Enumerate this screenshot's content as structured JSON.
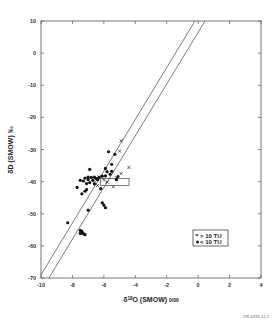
{
  "chart_data": {
    "type": "scatter",
    "title": "",
    "xlabel": "δ18O (SMOW) ‰",
    "ylabel": "δD (SMOW) ‰",
    "xlim": [
      -10,
      4
    ],
    "ylim": [
      -70,
      10
    ],
    "x_ticks": [
      -10,
      -8,
      -6,
      -4,
      -2,
      0,
      2,
      4
    ],
    "y_ticks": [
      10,
      0,
      -10,
      -20,
      -30,
      -40,
      -50,
      -60,
      -70
    ],
    "grid": false,
    "legend_position": "lower right inside",
    "series": [
      {
        "name": "> 10 TU",
        "marker": "x",
        "points": [
          [
            -4.9,
            -27.3
          ],
          [
            -5.0,
            -30.5
          ],
          [
            -4.4,
            -35.6
          ],
          [
            -4.9,
            -37.5
          ],
          [
            -5.8,
            -40.1
          ],
          [
            -5.4,
            -41.6
          ],
          [
            -6.0,
            -39.4
          ],
          [
            -6.6,
            -40.2
          ],
          [
            -5.2,
            -38.8
          ],
          [
            -6.3,
            -38.5
          ],
          [
            -6.4,
            -41.2
          ]
        ]
      },
      {
        "name": "< 10 TU",
        "marker": "filled-circle",
        "points": [
          [
            -5.7,
            -30.7
          ],
          [
            -5.3,
            -31.5
          ],
          [
            -5.5,
            -34.6
          ],
          [
            -5.9,
            -35.9
          ],
          [
            -6.9,
            -36.2
          ],
          [
            -5.5,
            -36.8
          ],
          [
            -5.8,
            -36.9
          ],
          [
            -5.6,
            -37.7
          ],
          [
            -5.9,
            -38.2
          ],
          [
            -6.1,
            -38.3
          ],
          [
            -6.3,
            -38.7
          ],
          [
            -6.6,
            -38.6
          ],
          [
            -6.8,
            -38.7
          ],
          [
            -7.0,
            -38.6
          ],
          [
            -7.2,
            -38.9
          ],
          [
            -6.5,
            -39.0
          ],
          [
            -6.4,
            -39.4
          ],
          [
            -6.7,
            -39.6
          ],
          [
            -7.0,
            -39.3
          ],
          [
            -7.3,
            -39.8
          ],
          [
            -7.5,
            -39.6
          ],
          [
            -6.9,
            -40.3
          ],
          [
            -7.1,
            -40.6
          ],
          [
            -6.6,
            -40.7
          ],
          [
            -5.1,
            -38.4
          ],
          [
            -5.2,
            -39.4
          ],
          [
            -7.7,
            -41.8
          ],
          [
            -6.2,
            -42.2
          ],
          [
            -7.1,
            -42.5
          ],
          [
            -7.2,
            -43.0
          ],
          [
            -7.4,
            -43.8
          ],
          [
            -6.1,
            -46.6
          ],
          [
            -6.0,
            -47.3
          ],
          [
            -5.9,
            -48.1
          ],
          [
            -7.0,
            -48.9
          ],
          [
            -8.3,
            -52.8
          ],
          [
            -7.5,
            -55.2
          ],
          [
            -7.4,
            -55.5
          ],
          [
            -7.5,
            -56.1
          ],
          [
            -7.3,
            -56.2
          ],
          [
            -7.2,
            -56.5
          ],
          [
            -7.4,
            -56.0
          ]
        ]
      }
    ],
    "reference_lines": [
      {
        "name": "upper line",
        "x": [
          -10,
          -0.2
        ],
        "y": [
          -69.0,
          10
        ]
      },
      {
        "name": "lower line",
        "x": [
          -9.5,
          0.44
        ],
        "y": [
          -70,
          10
        ]
      }
    ],
    "annotations": [
      {
        "type": "rectangle",
        "x": [
          -6.2,
          -4.4
        ],
        "y": [
          -41.2,
          -39.0
        ]
      }
    ]
  },
  "labels": {
    "xlabel_prefix": "δ",
    "xlabel_sup": "18",
    "xlabel_main": "O (SMOW) ",
    "xlabel_permil": "0/00",
    "ylabel": "δD (SMOW) ‰",
    "legend_gt": "> 10 TU",
    "legend_lt": "< 10 TU",
    "footer": "TRI-6331-12-1"
  }
}
